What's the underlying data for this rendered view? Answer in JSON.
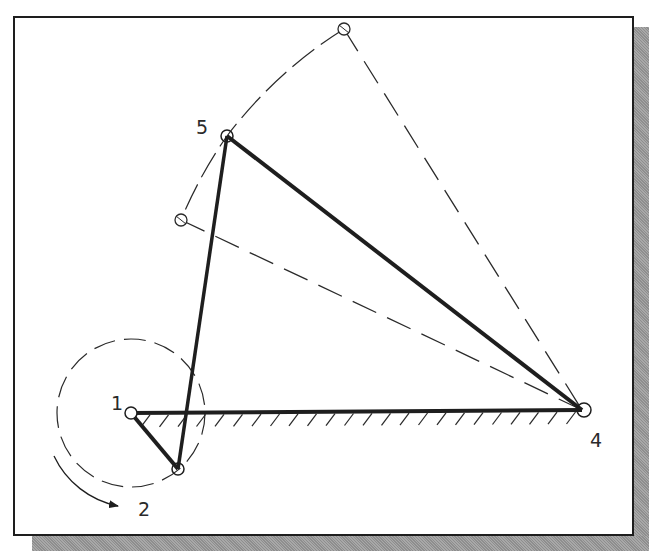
{
  "diagram": {
    "type": "four-bar linkage mechanism (CAD sketch)",
    "labels": {
      "joint_1": "1",
      "joint_2": "2",
      "joint_4": "4",
      "joint_5": "5"
    },
    "joints": {
      "p1": {
        "x": 131,
        "y": 413
      },
      "p2": {
        "x": 178,
        "y": 469
      },
      "p4": {
        "x": 582,
        "y": 410
      },
      "p5": {
        "x": 227,
        "y": 136
      },
      "ghost_upper": {
        "x": 344,
        "y": 29
      },
      "ghost_lower": {
        "x": 181,
        "y": 220
      }
    },
    "links": [
      {
        "name": "crank",
        "from": "p1",
        "to": "p2",
        "style": "solid-thick"
      },
      {
        "name": "coupler",
        "from": "p2",
        "to": "p5",
        "style": "solid-thick"
      },
      {
        "name": "rocker",
        "from": "p5",
        "to": "p4",
        "style": "solid-thick"
      },
      {
        "name": "ground",
        "from": "p1",
        "to": "p4",
        "style": "solid-thick-hatched"
      }
    ],
    "construction": {
      "crank_circle_radius": 74,
      "rocker_swing_arc": "dashed arc centered at joint 4 through joint 5",
      "extreme_positions": [
        "ghost_upper",
        "ghost_lower"
      ],
      "rotation_direction": "clockwise"
    },
    "colors": {
      "line": "#1e1e1e",
      "background": "#ffffff",
      "shadow": "#9a9a9a"
    }
  }
}
